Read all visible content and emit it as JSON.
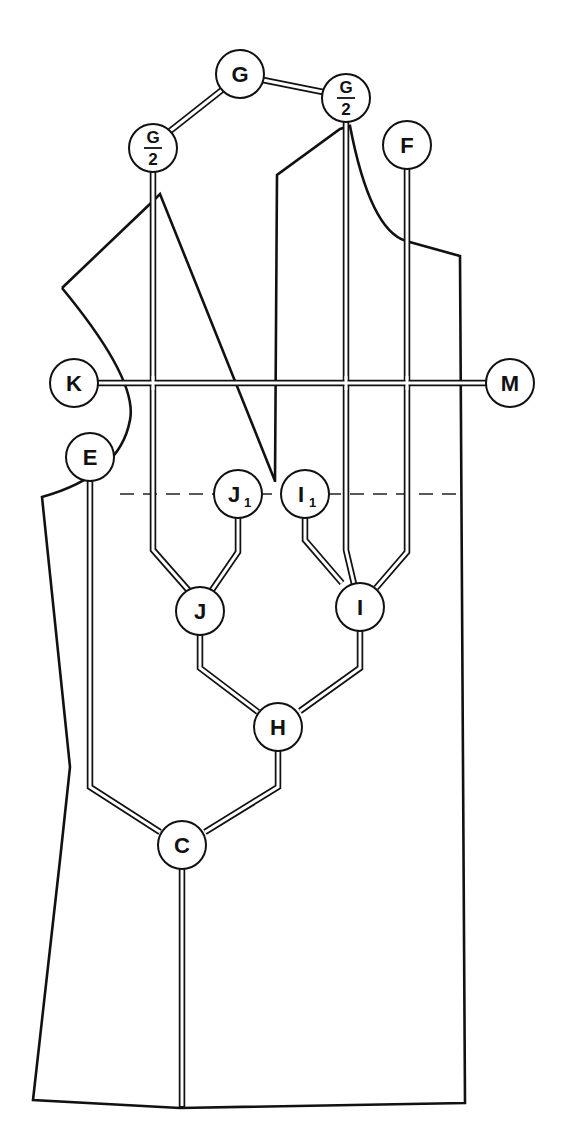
{
  "diagram": {
    "type": "pattern-drafting-node-diagram",
    "colors": {
      "line": "#111111",
      "background": "#ffffff"
    },
    "nodes": {
      "G": {
        "label": "G",
        "x": 240,
        "y": 74
      },
      "G2_left": {
        "numerator": "G",
        "denominator": "2",
        "x": 153,
        "y": 148
      },
      "G2_right": {
        "numerator": "G",
        "denominator": "2",
        "x": 346,
        "y": 98
      },
      "F": {
        "label": "F",
        "x": 407,
        "y": 145
      },
      "K": {
        "label": "K",
        "x": 74,
        "y": 383
      },
      "M": {
        "label": "M",
        "x": 510,
        "y": 383
      },
      "E": {
        "label": "E",
        "x": 90,
        "y": 457
      },
      "J1": {
        "label": "J",
        "sub": "1",
        "x": 238,
        "y": 494
      },
      "I1": {
        "label": "I",
        "sub": "1",
        "x": 305,
        "y": 494
      },
      "J": {
        "label": "J",
        "x": 200,
        "y": 611
      },
      "I": {
        "label": "I",
        "x": 360,
        "y": 607
      },
      "H": {
        "label": "H",
        "x": 278,
        "y": 727
      },
      "C": {
        "label": "C",
        "x": 182,
        "y": 845
      }
    }
  }
}
